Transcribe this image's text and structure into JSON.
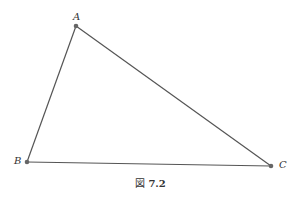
{
  "figure": {
    "caption_prefix": "図",
    "caption_number": "7.2",
    "points": [
      {
        "label": "A",
        "x": 76,
        "y": 26
      },
      {
        "label": "B",
        "x": 27,
        "y": 162
      },
      {
        "label": "C",
        "x": 271,
        "y": 166
      }
    ],
    "line_color": "#555555",
    "point_color": "#666666"
  }
}
